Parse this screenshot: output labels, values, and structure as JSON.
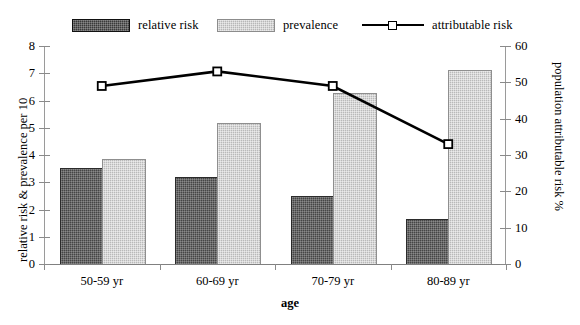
{
  "figure": {
    "background": "#ffffff",
    "x_axis_title": "age",
    "y_left_title": "relative risk & prevalence per 10",
    "y_right_title": "population attributable risk %",
    "caption_fragment": ""
  },
  "legend": {
    "entries": [
      {
        "label": "relative risk",
        "type": "swatch",
        "color": "#3a3a3a",
        "icon": "dark-hatch-swatch-icon"
      },
      {
        "label": "prevalence",
        "type": "swatch",
        "color": "#b7b7b7",
        "icon": "light-hatch-swatch-icon"
      },
      {
        "label": "attributable risk",
        "type": "line",
        "color": "#000000",
        "icon": "line-square-marker-icon"
      }
    ]
  },
  "chart_data": {
    "type": "bar",
    "title": "",
    "xlabel": "age",
    "ylabel": "relative risk & prevalence per 10",
    "y2label": "population attributable risk %",
    "categories": [
      "50-59 yr",
      "60-69 yr",
      "70-79 yr",
      "80-89 yr"
    ],
    "ylim": [
      0,
      8
    ],
    "yticks": [
      0,
      1,
      2,
      3,
      4,
      5,
      6,
      7,
      8
    ],
    "ytick_labels": [
      "0",
      "1",
      "2",
      "3",
      "4",
      "5",
      "6",
      "7",
      "8"
    ],
    "y2lim": [
      0,
      60
    ],
    "y2ticks": [
      0,
      10,
      20,
      30,
      40,
      50,
      60
    ],
    "y2tick_labels": [
      "0",
      "10",
      "20",
      "30",
      "40",
      "50",
      "60"
    ],
    "grid": false,
    "legend_position": "top",
    "series": [
      {
        "name": "relative risk",
        "kind": "bar",
        "axis": "left",
        "color": "#454545",
        "values": [
          3.5,
          3.15,
          2.45,
          1.6
        ]
      },
      {
        "name": "prevalence",
        "kind": "bar",
        "axis": "left",
        "color": "#b9b9b9",
        "values": [
          3.82,
          5.15,
          6.25,
          7.1
        ]
      },
      {
        "name": "attributable risk",
        "kind": "line",
        "axis": "right",
        "color": "#000000",
        "marker": "square",
        "values": [
          49,
          53,
          49,
          33
        ]
      }
    ]
  }
}
